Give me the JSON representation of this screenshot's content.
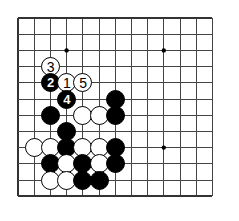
{
  "figure": {
    "kind": "go-board-diagram",
    "width": 239,
    "height": 221
  },
  "board": {
    "origin_x": 18,
    "origin_y": 18,
    "spacing": 16.2,
    "cols": 13,
    "rows": 12,
    "line_color": "#444444",
    "border_color": "#333333",
    "background_color": "#ffffff",
    "line_width": 1,
    "border_width": 2,
    "star_point_color": "#000000",
    "star_point_radius": 2.2,
    "star_points": [
      {
        "col": 3,
        "row": 2
      },
      {
        "col": 9,
        "row": 2
      },
      {
        "col": 9,
        "row": 8
      }
    ]
  },
  "stone_style": {
    "diameter": 19,
    "black_fill": "#000000",
    "white_fill": "#ffffff",
    "outline": "#000000"
  },
  "stones": [
    {
      "id": "w-move-3",
      "color": "white",
      "col": 2,
      "row": 3,
      "label": "3"
    },
    {
      "id": "b-move-2",
      "color": "black",
      "col": 2,
      "row": 4,
      "label": "2"
    },
    {
      "id": "w-move-1",
      "color": "white",
      "col": 3,
      "row": 4,
      "label": "1"
    },
    {
      "id": "w-move-5",
      "color": "white",
      "col": 4,
      "row": 4,
      "label": "5"
    },
    {
      "id": "b-move-4",
      "color": "black",
      "col": 3,
      "row": 5,
      "label": "4"
    },
    {
      "id": "b-r5-c6",
      "color": "black",
      "col": 6,
      "row": 5,
      "label": ""
    },
    {
      "id": "b-r6-c2",
      "color": "black",
      "col": 2,
      "row": 6,
      "label": ""
    },
    {
      "id": "w-r6-c4",
      "color": "white",
      "col": 4,
      "row": 6,
      "label": ""
    },
    {
      "id": "w-r6-c5",
      "color": "white",
      "col": 5,
      "row": 6,
      "label": ""
    },
    {
      "id": "b-r6-c6",
      "color": "black",
      "col": 6,
      "row": 6,
      "label": ""
    },
    {
      "id": "b-r7-c3",
      "color": "black",
      "col": 3,
      "row": 7,
      "label": ""
    },
    {
      "id": "w-r8-c1",
      "color": "white",
      "col": 1,
      "row": 8,
      "label": ""
    },
    {
      "id": "w-r8-c2",
      "color": "white",
      "col": 2,
      "row": 8,
      "label": ""
    },
    {
      "id": "b-r8-c3",
      "color": "black",
      "col": 3,
      "row": 8,
      "label": ""
    },
    {
      "id": "w-r8-c4",
      "color": "white",
      "col": 4,
      "row": 8,
      "label": ""
    },
    {
      "id": "w-r8-c5",
      "color": "white",
      "col": 5,
      "row": 8,
      "label": ""
    },
    {
      "id": "b-r8-c6",
      "color": "black",
      "col": 6,
      "row": 8,
      "label": ""
    },
    {
      "id": "b-r9-c2",
      "color": "black",
      "col": 2,
      "row": 9,
      "label": ""
    },
    {
      "id": "w-r9-c3",
      "color": "white",
      "col": 3,
      "row": 9,
      "label": ""
    },
    {
      "id": "b-r9-c4",
      "color": "black",
      "col": 4,
      "row": 9,
      "label": ""
    },
    {
      "id": "w-r9-c5",
      "color": "white",
      "col": 5,
      "row": 9,
      "label": ""
    },
    {
      "id": "b-r9-c6",
      "color": "black",
      "col": 6,
      "row": 9,
      "label": ""
    },
    {
      "id": "w-r10-c2",
      "color": "white",
      "col": 2,
      "row": 10,
      "label": ""
    },
    {
      "id": "w-r10-c3",
      "color": "white",
      "col": 3,
      "row": 10,
      "label": ""
    },
    {
      "id": "b-r10-c4",
      "color": "black",
      "col": 4,
      "row": 10,
      "label": ""
    },
    {
      "id": "b-r10-c5",
      "color": "black",
      "col": 5,
      "row": 10,
      "label": ""
    }
  ],
  "move_sequence": [
    {
      "number": "1",
      "color": "white"
    },
    {
      "number": "2",
      "color": "black"
    },
    {
      "number": "3",
      "color": "white"
    },
    {
      "number": "4",
      "color": "black"
    },
    {
      "number": "5",
      "color": "white"
    }
  ]
}
